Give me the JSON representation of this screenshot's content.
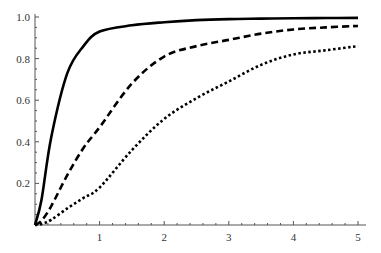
{
  "chart_data": {
    "type": "line",
    "title": "",
    "xlabel": "",
    "ylabel": "",
    "xlim": [
      0,
      5.1
    ],
    "ylim": [
      0,
      1.0
    ],
    "grid": false,
    "legend": null,
    "x_ticks": [
      1,
      2,
      3,
      4,
      5
    ],
    "x_tick_labels": [
      "1",
      "2",
      "3",
      "4",
      "5"
    ],
    "y_ticks": [
      0.2,
      0.4,
      0.6,
      0.8,
      1.0
    ],
    "y_tick_labels": [
      "0.2",
      "0.4",
      "0.6",
      "0.8",
      "1.0"
    ],
    "x": [
      0,
      0.1,
      0.25,
      0.5,
      0.75,
      1,
      1.5,
      2,
      2.5,
      3,
      3.5,
      4,
      4.5,
      5
    ],
    "series": [
      {
        "name": "solid",
        "style": "solid",
        "color": "#000000",
        "values": [
          0,
          0.12,
          0.42,
          0.73,
          0.86,
          0.93,
          0.96,
          0.975,
          0.985,
          0.99,
          0.992,
          0.994,
          0.995,
          0.996
        ]
      },
      {
        "name": "dashed",
        "style": "dashed",
        "color": "#000000",
        "values": [
          0,
          0.02,
          0.09,
          0.24,
          0.37,
          0.47,
          0.68,
          0.81,
          0.86,
          0.89,
          0.92,
          0.94,
          0.95,
          0.957
        ]
      },
      {
        "name": "dotted",
        "style": "dotted",
        "color": "#000000",
        "values": [
          0,
          0.005,
          0.025,
          0.08,
          0.13,
          0.18,
          0.36,
          0.51,
          0.61,
          0.69,
          0.77,
          0.82,
          0.84,
          0.86
        ]
      }
    ]
  }
}
